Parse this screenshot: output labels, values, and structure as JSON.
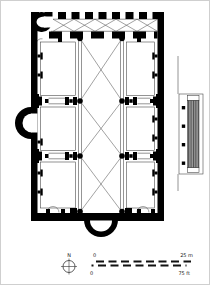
{
  "compass": {
    "north_label": "N"
  },
  "scale_bar": {
    "metric_zero": "0",
    "metric_max": "25 m",
    "imperial_zero": "0",
    "imperial_max": "75 ft"
  },
  "colors": {
    "wall": "#000000",
    "background": "#ffffff",
    "stair_block": "#9a9a9a",
    "stair_stripe": "#4d4d4d",
    "thin_line": "#3c3c3c",
    "text": "#1a1a1a"
  }
}
